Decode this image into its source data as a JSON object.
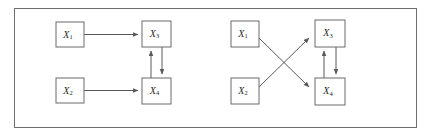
{
  "figure": {
    "type": "causal-graph-pair",
    "border_color": "#6e6e6e",
    "background_color": "#ffffff",
    "node_stroke_color": "#6a6a6a",
    "edge_color": "#5a5a5a",
    "panels": [
      {
        "id": "left-panel",
        "name": "left-diagram",
        "nodes": [
          {
            "id": "L1",
            "label": "X",
            "subscript": "1",
            "x": 56,
            "y": 22,
            "w": 28,
            "h": 25
          },
          {
            "id": "L2",
            "label": "X",
            "subscript": "2",
            "x": 56,
            "y": 78,
            "w": 28,
            "h": 25
          },
          {
            "id": "L3",
            "label": "X",
            "subscript": "3",
            "x": 142,
            "y": 21,
            "w": 29,
            "h": 26
          },
          {
            "id": "L4",
            "label": "X",
            "subscript": "4",
            "x": 142,
            "y": 78,
            "w": 29,
            "h": 26
          }
        ],
        "edges": [
          {
            "from": "L1",
            "to": "L3",
            "kind": "directed",
            "shape": "horizontal"
          },
          {
            "from": "L2",
            "to": "L4",
            "kind": "directed",
            "shape": "horizontal"
          },
          {
            "from": "L4",
            "to": "L3",
            "kind": "directed",
            "shape": "vertical-up"
          },
          {
            "from": "L3",
            "to": "L4",
            "kind": "directed",
            "shape": "vertical-down"
          }
        ]
      },
      {
        "id": "right-panel",
        "name": "right-diagram",
        "nodes": [
          {
            "id": "R1",
            "label": "X",
            "subscript": "1",
            "x": 231,
            "y": 21,
            "w": 28,
            "h": 26
          },
          {
            "id": "R2",
            "label": "X",
            "subscript": "2",
            "x": 231,
            "y": 78,
            "w": 28,
            "h": 26
          },
          {
            "id": "R3",
            "label": "X",
            "subscript": "3",
            "x": 315,
            "y": 20,
            "w": 30,
            "h": 27
          },
          {
            "id": "R4",
            "label": "X",
            "subscript": "4",
            "x": 315,
            "y": 78,
            "w": 30,
            "h": 27
          }
        ],
        "edges": [
          {
            "from": "R1",
            "to": "R4",
            "kind": "directed",
            "shape": "diagonal-down"
          },
          {
            "from": "R2",
            "to": "R3",
            "kind": "directed",
            "shape": "diagonal-up"
          },
          {
            "from": "R4",
            "to": "R3",
            "kind": "directed",
            "shape": "vertical-up"
          },
          {
            "from": "R3",
            "to": "R4",
            "kind": "directed",
            "shape": "vertical-down"
          }
        ]
      }
    ]
  }
}
